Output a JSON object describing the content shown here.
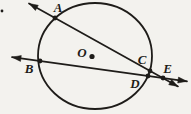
{
  "figure": {
    "background_color": "#f3f2ee",
    "ink_color": "#1e1c19",
    "labels": {
      "A": "A",
      "B": "B",
      "C": "C",
      "D": "D",
      "E": "E",
      "O": "O"
    },
    "circle": {
      "cx": 95,
      "cy": 56,
      "rx": 57,
      "ry": 53
    },
    "points": {
      "A": {
        "x": 55,
        "y": 18
      },
      "B": {
        "x": 40,
        "y": 61
      },
      "C": {
        "x": 150,
        "y": 71
      },
      "D": {
        "x": 148,
        "y": 76
      },
      "E": {
        "x": 163,
        "y": 78
      },
      "center": {
        "x": 92,
        "y": 56.5
      }
    },
    "label_positions": {
      "A": {
        "x": 58,
        "y": 12
      },
      "B": {
        "x": 29,
        "y": 73
      },
      "C": {
        "x": 142,
        "y": 64
      },
      "D": {
        "x": 135,
        "y": 88
      },
      "E": {
        "x": 167.5,
        "y": 73
      },
      "O": {
        "x": 82,
        "y": 57
      }
    },
    "lines": [
      {
        "name": "secant-ACE",
        "x1": 29,
        "y1": 3.5,
        "x2": 178,
        "y2": 86.4
      },
      {
        "name": "secant-BDE",
        "x1": 12,
        "y1": 57.2,
        "x2": 187,
        "y2": 81.3
      }
    ],
    "stray_mark": {
      "x": 2,
      "y": 11
    }
  }
}
